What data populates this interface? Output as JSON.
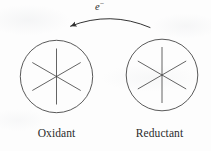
{
  "figure": {
    "type": "reaction-scheme",
    "background_color": "#fdfdfd",
    "stroke_color": "#3a3a3a",
    "text_color": "#2c2c2c",
    "caption_font_size_px": 11.5
  },
  "species": [
    {
      "id": "oxidant",
      "label": "Oxidant",
      "shape": "circle",
      "center": {
        "x": 56.5,
        "y": 76.5
      },
      "radius": 36.5,
      "interior_pattern": "six-spoke-star",
      "spoke_count": 6,
      "spoke_radius": 28
    },
    {
      "id": "reductant",
      "label": "Reductant",
      "shape": "circle",
      "center": {
        "x": 162,
        "y": 75
      },
      "radius": 36,
      "interior_pattern": "six-spoke-star",
      "spoke_count": 6,
      "spoke_radius": 28
    }
  ],
  "arrow": {
    "label": "e",
    "label_superscript": "−",
    "label_full": "e−",
    "direction": "right-to-left",
    "style": "curved",
    "head": "filled-triangle",
    "tail": {
      "x": 150,
      "y": 27
    },
    "tip": {
      "x": 68,
      "y": 27
    },
    "apex": {
      "x": 110,
      "y": 18
    },
    "meaning": "electron transfer from reductant to oxidant"
  }
}
